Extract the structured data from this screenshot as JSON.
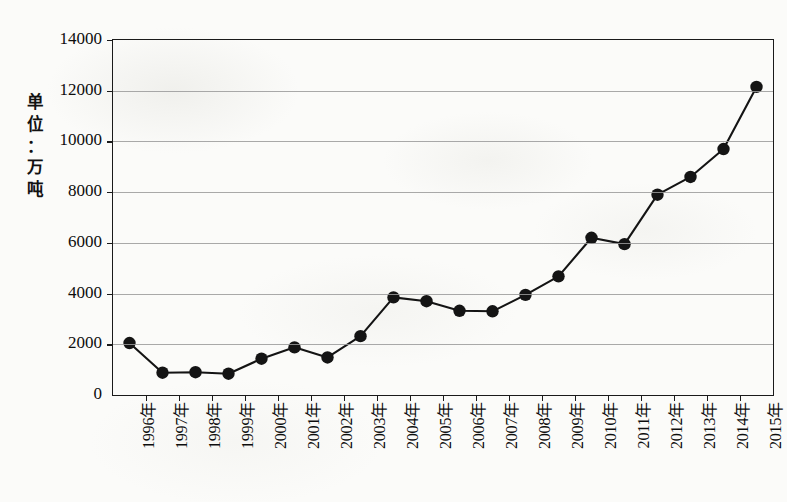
{
  "chart_data": {
    "type": "line",
    "title": "",
    "xlabel": "",
    "ylabel": "单位：万吨",
    "ylabel_chars": [
      "单",
      "位",
      "：",
      "万",
      "吨"
    ],
    "categories": [
      "1996年",
      "1997年",
      "1998年",
      "1999年",
      "2000年",
      "2001年",
      "2002年",
      "2003年",
      "2004年",
      "2005年",
      "2006年",
      "2007年",
      "2008年",
      "2009年",
      "2010年",
      "2011年",
      "2012年",
      "2013年",
      "2014年",
      "2015年"
    ],
    "values": [
      2050,
      880,
      900,
      840,
      1430,
      1880,
      1480,
      2320,
      3850,
      3700,
      3320,
      3300,
      3950,
      4680,
      6200,
      5950,
      7900,
      8600,
      9700,
      12150
    ],
    "ylim": [
      0,
      14000
    ],
    "ytick_values": [
      0,
      2000,
      4000,
      6000,
      8000,
      10000,
      12000,
      14000
    ],
    "ytick_labels": [
      "0",
      "2000",
      "4000",
      "6000",
      "8000",
      "10000",
      "12000",
      "14000"
    ],
    "grid": true,
    "legend": false,
    "legend_position": "none",
    "marker": "filled-circle",
    "line_color": "#141414",
    "marker_color": "#141414",
    "grid_color": "#9a9a9a",
    "axis_color": "#1a1a1a",
    "background_color": "#fbfbf9"
  }
}
